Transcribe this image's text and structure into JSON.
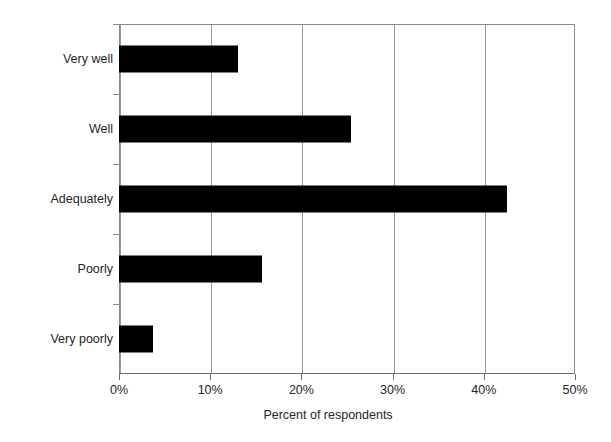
{
  "chart_data": {
    "type": "bar",
    "orientation": "horizontal",
    "title": "",
    "xlabel": "Percent of respondents",
    "ylabel": "",
    "categories": [
      "Very well",
      "Well",
      "Adequately",
      "Poorly",
      "Very poorly"
    ],
    "values": [
      13.0,
      25.4,
      42.5,
      15.7,
      3.7
    ],
    "series": [
      {
        "name": "Percent of respondents",
        "values": [
          13.0,
          25.4,
          42.5,
          15.7,
          3.7
        ]
      }
    ],
    "xlim": [
      0,
      50
    ],
    "xtick_labels": [
      "0%",
      "10%",
      "20%",
      "30%",
      "40%",
      "50%"
    ],
    "xtick_values": [
      0,
      10,
      20,
      30,
      40,
      50
    ],
    "ytick_labels": [
      "Very well",
      "Well",
      "Adequately",
      "Poorly",
      "Very poorly"
    ],
    "grid": "vertical",
    "legend": "none",
    "bar_color": "#000000",
    "axis_color": "#8a8a8a",
    "gridline_color": "#9a9a9a",
    "background_color": "#ffffff"
  }
}
